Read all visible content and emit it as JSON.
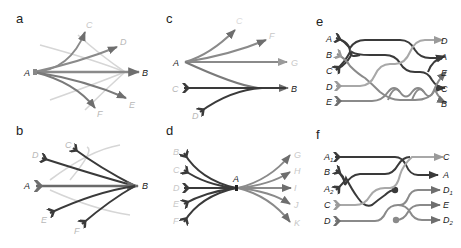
{
  "figure": {
    "panels": [
      {
        "id": "a",
        "label": "a",
        "title": "Panel a: fan-out from A to targets, with faint background paths",
        "nodes": {
          "source": "A",
          "targets": [
            "C",
            "D",
            "B",
            "E",
            "F"
          ]
        }
      },
      {
        "id": "b",
        "label": "b",
        "title": "Panel b: fan-in from sources to B",
        "nodes": {
          "sources": [
            "C",
            "D",
            "A",
            "E",
            "F"
          ],
          "target": "B"
        }
      },
      {
        "id": "c",
        "label": "c",
        "title": "Panel c: A branches to C, F, G, B; C and D merge into B",
        "nodes": {
          "labels": [
            "A",
            "C",
            "D",
            "B",
            "G",
            "F",
            "C_top"
          ]
        }
      },
      {
        "id": "d",
        "label": "d",
        "title": "Panel d: sources B–F converge at A then diverge to G–K",
        "nodes": {
          "sources": [
            "B",
            "C",
            "D",
            "E",
            "F"
          ],
          "hub": "A",
          "targets": [
            "G",
            "H",
            "I",
            "J",
            "K"
          ]
        }
      },
      {
        "id": "e",
        "label": "e",
        "title": "Panel e: rerouting braid",
        "nodes": {
          "left": [
            "A",
            "B",
            "C",
            "D",
            "E"
          ],
          "right": [
            "D",
            "A",
            "E",
            "C",
            "B"
          ]
        }
      },
      {
        "id": "f",
        "label": "f",
        "title": "Panel f: rerouting with splits",
        "nodes": {
          "left": [
            "A1",
            "B",
            "A2",
            "C",
            "D"
          ],
          "right": [
            "C",
            "A",
            "D1",
            "E",
            "D2"
          ]
        }
      }
    ],
    "labels": {
      "a": {
        "A": "A",
        "B": "B",
        "C": "C",
        "D": "D",
        "E": "E",
        "F": "F"
      },
      "b": {
        "A": "A",
        "B": "B",
        "C": "C",
        "D": "D",
        "E": "E",
        "F": "F"
      },
      "c": {
        "A": "A",
        "B": "B",
        "C": "C",
        "D": "D",
        "F": "F",
        "G": "G",
        "top": "C"
      },
      "d": {
        "A": "A",
        "B": "B",
        "C": "C",
        "D": "D",
        "E": "E",
        "F": "F",
        "G": "G",
        "H": "H",
        "I": "I",
        "J": "J",
        "K": "K"
      },
      "e": {
        "A": "A",
        "B": "B",
        "C": "C",
        "D": "D",
        "E": "E",
        "rD": "D",
        "rA": "A",
        "rE": "E",
        "rC": "C",
        "rB": "B"
      },
      "f": {
        "A1": "A",
        "A1sub": "1",
        "B": "B",
        "A2": "A",
        "A2sub": "2",
        "C": "C",
        "D": "D",
        "rC": "C",
        "rA": "A",
        "rD1": "D",
        "rD1sub": "1",
        "rE": "E",
        "rD2": "D",
        "rD2sub": "2"
      }
    },
    "colors": {
      "dark": "#3a3a3a",
      "mid": "#6e6e6e",
      "light": "#9a9a9a",
      "faint": "#cfcfcf",
      "label_dark": "#222222",
      "label_faint": "#bdbdbd"
    }
  }
}
